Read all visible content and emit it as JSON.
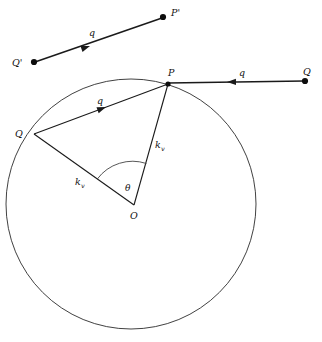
{
  "figure": {
    "name": "ewald-sphere-scattering-diagram",
    "background": "#ffffff",
    "stroke_color": "#1a1a1a",
    "width": 322,
    "height": 342
  },
  "labels": {
    "p_prime": "P'",
    "q_prime": "Q'",
    "q_top": "q",
    "p": "P",
    "q_right_point": "Q",
    "q_right": "q",
    "q_inner": "q",
    "q_circle": "Q",
    "kv_left": "k",
    "kv_left_sub": "v",
    "kv_right": "k",
    "kv_right_sub": "v",
    "theta": "θ",
    "origin": "O"
  },
  "geometry": {
    "circle": {
      "cx": 131,
      "cy": 204,
      "r": 125
    },
    "points": {
      "O": {
        "x": 134,
        "y": 205
      },
      "P": {
        "x": 168,
        "y": 84
      },
      "Q": {
        "x": 33,
        "y": 134
      },
      "Q_right": {
        "x": 305,
        "y": 81
      },
      "P_prime": {
        "x": 163,
        "y": 17
      },
      "Q_prime": {
        "x": 33,
        "y": 62
      }
    },
    "angle_arc": {
      "radius": 44,
      "theta_label_deg": 72
    }
  }
}
